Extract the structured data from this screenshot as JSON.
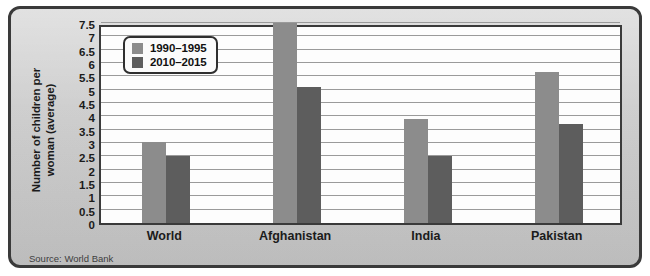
{
  "source_note": "Source: World Bank",
  "axis": {
    "y_title_line1": "Number of children per",
    "y_title_line2": "woman (average)",
    "y_ticks": [
      "7.5",
      "7",
      "6.5",
      "6",
      "5.5",
      "5",
      "4.5",
      "4",
      "3.5",
      "3",
      "2.5",
      "2",
      "1.5",
      "1",
      "0.5",
      "0"
    ]
  },
  "legend": {
    "items": [
      {
        "label": "1990–1995",
        "color": "#8c8c8c"
      },
      {
        "label": "2010–2015",
        "color": "#5d5d5d"
      }
    ]
  },
  "colors": {
    "series_1990_1995": "#8c8c8c",
    "series_2010_2015": "#5d5d5d",
    "card_background": "#cfcfcf",
    "plot_background": "#fdfdfd",
    "border": "#3a3a3a",
    "gridline": "#9a9a9a",
    "text": "#1b1b1b"
  },
  "chart_data": {
    "type": "bar",
    "title": "",
    "xlabel": "",
    "ylabel": "Number of children per woman (average)",
    "ylim": [
      0,
      7.5
    ],
    "ytick_step": 0.5,
    "grid": true,
    "legend_position": "top-left",
    "categories": [
      "World",
      "Afghanistan",
      "India",
      "Pakistan"
    ],
    "series": [
      {
        "name": "1990–1995",
        "color": "#8c8c8c",
        "values": [
          3.05,
          7.5,
          3.9,
          5.65
        ]
      },
      {
        "name": "2010–2015",
        "color": "#5d5d5d",
        "values": [
          2.5,
          5.1,
          2.5,
          3.7
        ]
      }
    ],
    "source": "World Bank"
  }
}
